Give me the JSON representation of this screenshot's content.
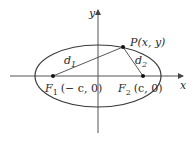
{
  "diagram": {
    "axes": {
      "x_label": "x",
      "y_label": "y"
    },
    "ellipse": {
      "cx": 98,
      "cy": 76,
      "rx": 63,
      "ry": 31
    },
    "points": {
      "P": {
        "label": "P(x, y)",
        "x": 123,
        "y": 47
      },
      "F1": {
        "label_main": "F",
        "label_sub": "1",
        "label_coord": "(− c, 0)",
        "x": 53,
        "y": 76
      },
      "F2": {
        "label_main": "F",
        "label_sub": "2",
        "label_coord": "(c, 0)",
        "x": 143,
        "y": 76
      }
    },
    "segments": {
      "d1": {
        "label_main": "d",
        "label_sub": "1"
      },
      "d2": {
        "label_main": "d",
        "label_sub": "2"
      }
    },
    "colors": {
      "stroke": "#3a3a3a",
      "axis": "#555555"
    }
  }
}
